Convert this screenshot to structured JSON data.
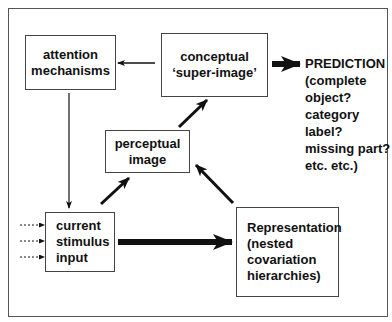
{
  "diagram": {
    "nodes": {
      "attention": {
        "lines": [
          "attention",
          "mechanisms"
        ]
      },
      "conceptual": {
        "lines": [
          "conceptual",
          "‘super-image’"
        ]
      },
      "perceptual": {
        "lines": [
          "perceptual",
          "image"
        ]
      },
      "stimulus": {
        "lines": [
          "current",
          "stimulus",
          "input"
        ]
      },
      "representation": {
        "lines": [
          "Representation",
          "(nested",
          "covariation",
          "hierarchies)"
        ]
      }
    },
    "prediction": {
      "lines": [
        "PREDICTION",
        "(complete",
        "object?",
        "category",
        "label?",
        "missing part?",
        "etc. etc.)"
      ]
    },
    "edges": [
      {
        "from": "conceptual",
        "to": "attention",
        "style": "thin"
      },
      {
        "from": "attention",
        "to": "stimulus",
        "style": "thin"
      },
      {
        "from": "stimulus",
        "to": "perceptual",
        "style": "medium"
      },
      {
        "from": "perceptual",
        "to": "conceptual",
        "style": "medium"
      },
      {
        "from": "representation",
        "to": "perceptual",
        "style": "medium"
      },
      {
        "from": "stimulus",
        "to": "representation",
        "style": "thick"
      },
      {
        "from": "conceptual",
        "to": "prediction",
        "style": "thick"
      },
      {
        "from": "external",
        "to": "stimulus",
        "style": "dotted",
        "count": 3
      }
    ]
  }
}
